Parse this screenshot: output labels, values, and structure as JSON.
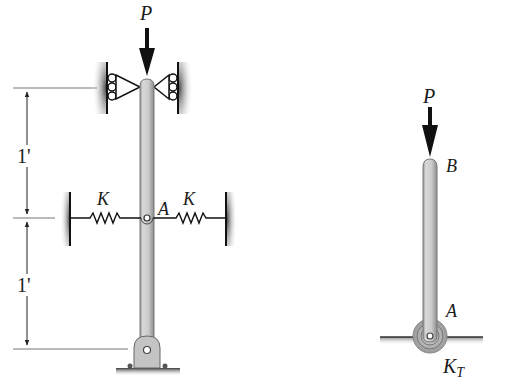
{
  "figure": {
    "left_system": {
      "load_label": "P",
      "joint_label": "A",
      "spring_left_label": "K",
      "spring_right_label": "K",
      "dimensions": [
        {
          "label": "1'",
          "from": "top support",
          "to": "A"
        },
        {
          "label": "1'",
          "from": "A",
          "to": "base pin"
        }
      ],
      "top_support": "roller guides (both sides)",
      "base_support": "pin"
    },
    "right_system": {
      "load_label": "P",
      "top_label": "B",
      "base_label": "A",
      "torsion_spring_label": "K",
      "torsion_spring_subscript": "T",
      "base_support": "pin with torsional spring"
    },
    "colors": {
      "rod_fill": "#c9c9c9",
      "rod_edge": "#7a7a7a",
      "ink": "#1a1a1a",
      "line": "#555555"
    }
  }
}
